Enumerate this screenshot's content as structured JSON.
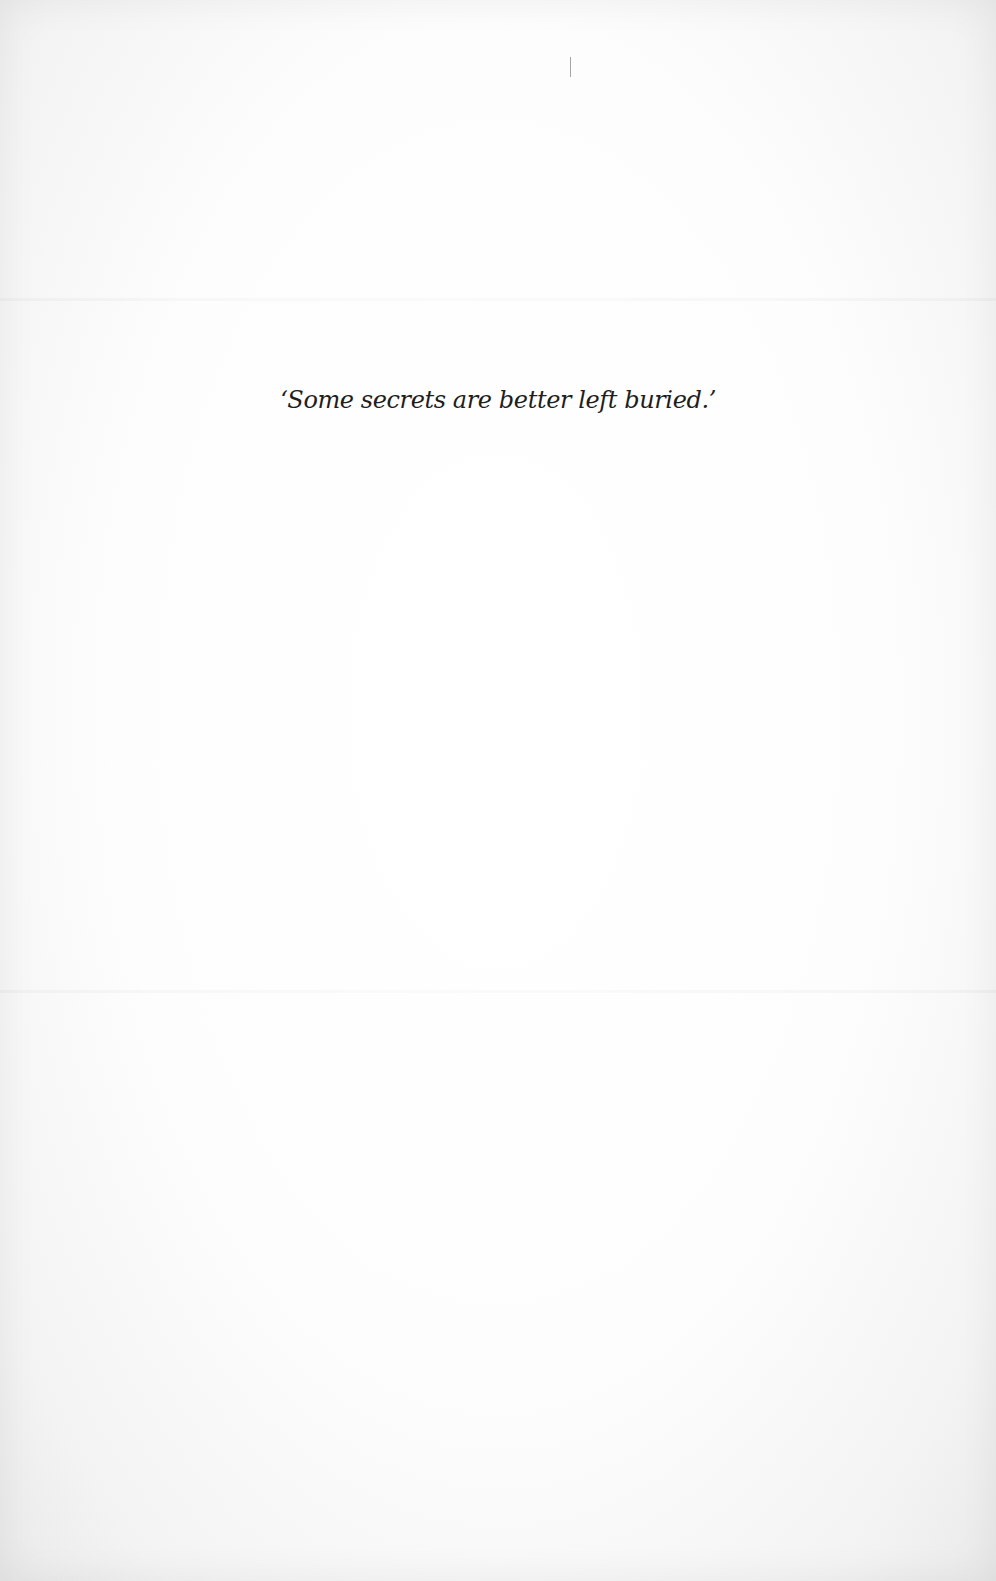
{
  "page": {
    "epigraph": "‘Some secrets are better left buried.’",
    "background_color": "#fefefe",
    "text_color": "#1e1e1e"
  }
}
